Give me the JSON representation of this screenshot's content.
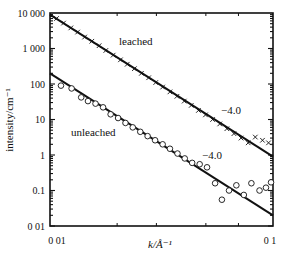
{
  "chart_data": {
    "type": "scatter",
    "title": "",
    "xlabel": "k/Å⁻¹",
    "ylabel": "intensity/cm⁻¹",
    "xscale": "log",
    "yscale": "log",
    "xlim": [
      0.01,
      0.1
    ],
    "ylim": [
      0.01,
      10000
    ],
    "x_ticks": [
      "0 01",
      "0 1"
    ],
    "y_ticks": [
      "10 000",
      "1 000",
      "100",
      "10",
      "1",
      "0.1",
      "0 01"
    ],
    "grid": false,
    "legend": "none",
    "series": [
      {
        "name": "leached",
        "marker": "x",
        "points": [
          [
            0.0107,
            7000
          ],
          [
            0.0115,
            5200
          ],
          [
            0.0124,
            3800
          ],
          [
            0.0133,
            2900
          ],
          [
            0.0143,
            2100
          ],
          [
            0.0154,
            1600
          ],
          [
            0.0166,
            1200
          ],
          [
            0.0178,
            880
          ],
          [
            0.0192,
            650
          ],
          [
            0.0207,
            480
          ],
          [
            0.0222,
            360
          ],
          [
            0.0239,
            270
          ],
          [
            0.0257,
            200
          ],
          [
            0.0277,
            150
          ],
          [
            0.0298,
            110
          ],
          [
            0.032,
            82
          ],
          [
            0.0345,
            60
          ],
          [
            0.0371,
            45
          ],
          [
            0.04,
            33
          ],
          [
            0.043,
            25
          ],
          [
            0.0463,
            18
          ],
          [
            0.0498,
            13.5
          ],
          [
            0.0536,
            10
          ],
          [
            0.0577,
            7.5
          ],
          [
            0.0621,
            5.5
          ],
          [
            0.0668,
            4.0
          ],
          [
            0.0719,
            3.0
          ],
          [
            0.0774,
            2.2
          ],
          [
            0.0833,
            3.2
          ],
          [
            0.0897,
            2.6
          ],
          [
            0.0955,
            2.2
          ]
        ],
        "fit_line": {
          "slope": -4.0,
          "x": [
            0.01,
            0.1
          ],
          "y": [
            9000,
            0.9
          ]
        }
      },
      {
        "name": "unleached",
        "marker": "o",
        "points": [
          [
            0.0112,
            90
          ],
          [
            0.0125,
            75
          ],
          [
            0.0138,
            42
          ],
          [
            0.0148,
            33
          ],
          [
            0.016,
            28
          ],
          [
            0.0173,
            22
          ],
          [
            0.0187,
            14
          ],
          [
            0.0202,
            11
          ],
          [
            0.0218,
            8
          ],
          [
            0.0235,
            6
          ],
          [
            0.0254,
            4.5
          ],
          [
            0.0274,
            3.4
          ],
          [
            0.0296,
            2.6
          ],
          [
            0.032,
            2.0
          ],
          [
            0.0345,
            1.5
          ],
          [
            0.0373,
            1.1
          ],
          [
            0.0402,
            0.8
          ],
          [
            0.0434,
            0.6
          ],
          [
            0.0469,
            0.55
          ],
          [
            0.0506,
            0.45
          ],
          [
            0.055,
            0.16
          ],
          [
            0.059,
            0.055
          ],
          [
            0.0635,
            0.1
          ],
          [
            0.0685,
            0.14
          ],
          [
            0.074,
            0.075
          ],
          [
            0.08,
            0.16
          ],
          [
            0.087,
            0.1
          ],
          [
            0.093,
            0.12
          ],
          [
            0.098,
            0.17
          ]
        ],
        "fit_line": {
          "slope": -4.0,
          "x": [
            0.01,
            0.1
          ],
          "y": [
            200,
            0.02
          ]
        }
      }
    ],
    "annotations": [
      {
        "text": "leached",
        "x": 0.033,
        "y": 1000
      },
      {
        "text": "unleached",
        "x": 0.0145,
        "y": 5
      },
      {
        "text": "−4.0",
        "x": 0.064,
        "y": 3.5
      },
      {
        "text": "−4.0",
        "x": 0.044,
        "y": 0.9
      }
    ]
  },
  "labels": {
    "leached": "leached",
    "unleached": "unleached",
    "slope_leached": "−4.0",
    "slope_unleached": "−4.0",
    "ylabel": "intensity/cm⁻¹",
    "xlabel": "k/Å⁻¹",
    "y_ticks": [
      "10 000",
      "1 000",
      "100",
      "10",
      "1",
      "0.1",
      "0 01"
    ],
    "x_ticks": [
      "0 01",
      "0 1"
    ]
  }
}
